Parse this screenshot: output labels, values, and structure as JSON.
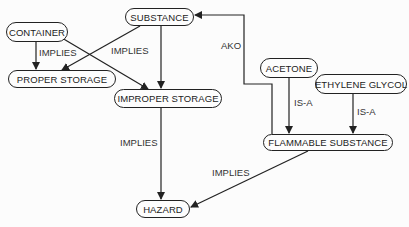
{
  "diagram": {
    "type": "semantic-network",
    "nodes": [
      {
        "id": "container",
        "label": "CONTAINER"
      },
      {
        "id": "substance",
        "label": "SUBSTANCE"
      },
      {
        "id": "proper_storage",
        "label": "PROPER STORAGE"
      },
      {
        "id": "improper_storage",
        "label": "IMPROPER STORAGE"
      },
      {
        "id": "acetone",
        "label": "ACETONE"
      },
      {
        "id": "ethylene_glycol",
        "label": "ETHYLENE GLYCOL"
      },
      {
        "id": "flammable_substance",
        "label": "FLAMMABLE SUBSTANCE"
      },
      {
        "id": "hazard",
        "label": "HAZARD"
      }
    ],
    "edges": [
      {
        "from": "container",
        "to": "proper_storage",
        "label": "IMPLIES"
      },
      {
        "from": "container",
        "to": "improper_storage",
        "label": ""
      },
      {
        "from": "substance",
        "to": "proper_storage",
        "label": "IMPLIES"
      },
      {
        "from": "substance",
        "to": "improper_storage",
        "label": ""
      },
      {
        "from": "improper_storage",
        "to": "hazard",
        "label": "IMPLIES"
      },
      {
        "from": "flammable_substance",
        "to": "substance",
        "label": "AKO"
      },
      {
        "from": "acetone",
        "to": "flammable_substance",
        "label": "IS-A"
      },
      {
        "from": "ethylene_glycol",
        "to": "flammable_substance",
        "label": "IS-A"
      },
      {
        "from": "flammable_substance",
        "to": "hazard",
        "label": "IMPLIES"
      }
    ]
  },
  "labels": {
    "implies_container": "IMPLIES",
    "implies_substance": "IMPLIES",
    "implies_improper": "IMPLIES",
    "implies_flammable": "IMPLIES",
    "ako": "AKO",
    "isa_acetone": "IS-A",
    "isa_glycol": "IS-A"
  }
}
